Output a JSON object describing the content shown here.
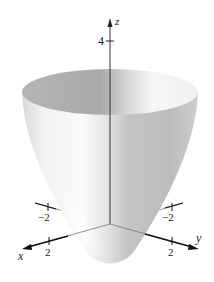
{
  "figure": {
    "type": "3d-surface-plot",
    "surface": "elliptic paraboloid z = x^2 + y^2",
    "axes": {
      "x": {
        "label": "x",
        "ticks": [
          "-2",
          "2"
        ]
      },
      "y": {
        "label": "y",
        "ticks": [
          "-2",
          "2"
        ]
      },
      "z": {
        "label": "z",
        "ticks": [
          "4"
        ]
      }
    },
    "colors": {
      "axis": "#222222",
      "surface_light": "#fafafa",
      "surface_dark": "#bdbdbd",
      "inner_dark": "#a8a8a8"
    }
  }
}
